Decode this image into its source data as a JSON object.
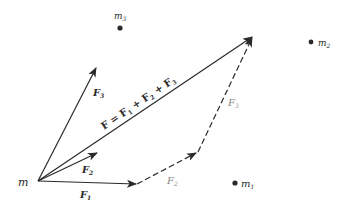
{
  "diagram": {
    "type": "vector-force-addition",
    "colors": {
      "ink": "#2a2a2a",
      "faint": "#8a8a8a",
      "background": "#ffffff"
    },
    "particle": {
      "label": "m"
    },
    "masses": [
      {
        "label_base": "m",
        "label_sub": "1"
      },
      {
        "label_base": "m",
        "label_sub": "2"
      },
      {
        "label_base": "m",
        "label_sub": "3"
      }
    ],
    "vectors": [
      {
        "name": "F1",
        "label_base": "F",
        "label_sub": "1",
        "style": "solid"
      },
      {
        "name": "F2",
        "label_base": "F",
        "label_sub": "2",
        "style": "solid"
      },
      {
        "name": "F3",
        "label_base": "F",
        "label_sub": "3",
        "style": "solid"
      },
      {
        "name": "F2-translated",
        "label_base": "F",
        "label_sub": "2",
        "style": "dashed"
      },
      {
        "name": "F3-translated",
        "label_base": "F",
        "label_sub": "3",
        "style": "dashed"
      }
    ],
    "resultant": {
      "label_F": "F",
      "eq": " = ",
      "t1": "F",
      "s1": "1",
      "plus1": " + ",
      "t2": "F",
      "s2": "2",
      "plus2": " + ",
      "t3": "F",
      "s3": "3"
    }
  }
}
